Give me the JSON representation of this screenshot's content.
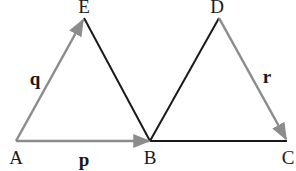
{
  "diagram": {
    "type": "vector-triangles",
    "colors": {
      "vector_line": "#8c8c8c",
      "plain_line": "#1a1a1a",
      "text": "#1a1a1a",
      "background": "#ffffff"
    },
    "points": {
      "A": {
        "label": "A",
        "x": 16,
        "y": 141
      },
      "E": {
        "label": "E",
        "x": 84,
        "y": 18
      },
      "B": {
        "label": "B",
        "x": 150,
        "y": 141
      },
      "D": {
        "label": "D",
        "x": 219,
        "y": 18
      },
      "C": {
        "label": "C",
        "x": 287,
        "y": 141
      }
    },
    "vectors": [
      {
        "name": "q",
        "from": "A",
        "to": "E",
        "label": "q"
      },
      {
        "name": "p",
        "from": "A",
        "to": "B",
        "label": "p"
      },
      {
        "name": "r",
        "from": "D",
        "to": "C",
        "label": "r"
      }
    ],
    "segments": [
      {
        "from": "E",
        "to": "B"
      },
      {
        "from": "B",
        "to": "D"
      },
      {
        "from": "B",
        "to": "C"
      }
    ]
  }
}
